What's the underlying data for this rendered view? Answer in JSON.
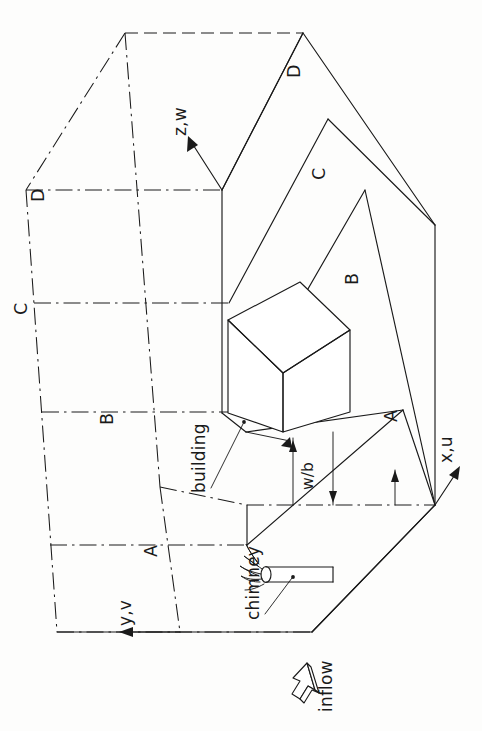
{
  "figure": {
    "background_color": "#fdfdfc",
    "line_color": "#1a1a1a",
    "orientation_note": "rotated 90 degrees; all text reads bottom-to-top"
  },
  "axes": {
    "z_label": "z,w",
    "x_label": "x,u",
    "y_label": "y,v"
  },
  "annotations": {
    "building_label": "building",
    "chimney_label": "chimney",
    "inflow_label": "inflow",
    "dimension_label": "w/b"
  },
  "section_planes": {
    "left_edge": [
      "D",
      "C",
      "B",
      "A"
    ],
    "right_edge": [
      "D",
      "C",
      "B",
      "A"
    ]
  },
  "icons": {
    "inflow_arrow": "block-arrow-icon",
    "axis_arrow": "arrowhead-icon",
    "smoke_plume": "smoke-plume-icon"
  }
}
